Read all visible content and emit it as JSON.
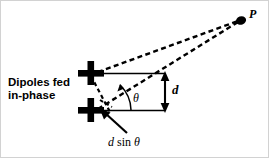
{
  "figure": {
    "background_color": "#ffffff",
    "stroke_color": "#000000",
    "border_color": "#cfcfcf",
    "width": 269,
    "height": 158
  },
  "labels": {
    "caption_line1": "Dipoles fed",
    "caption_line2": "in-phase",
    "caption_full": "Dipoles fed in-phase",
    "point_p": "P",
    "spacing_d": "d",
    "angle_theta": "θ",
    "path_difference_d": "d",
    "path_difference_sin": "sin",
    "path_difference_theta": "θ",
    "path_difference_full": "d sin θ"
  },
  "elements": {
    "dipole_top_name": "dipole-top",
    "dipole_bottom_name": "dipole-bottom",
    "observation_point_name": "observation-point-P",
    "ray_top_name": "dashed-ray-top-dipole-to-P",
    "ray_bottom_name": "dashed-ray-bottom-dipole-to-P",
    "baseline_top_name": "solid-horizontal-reference-top",
    "baseline_bottom_name": "solid-horizontal-reference-bottom",
    "spacing_arrow_name": "double-headed-spacing-arrow",
    "angle_arc_name": "angle-arc-theta",
    "path_diff_segment_name": "dashed-path-difference-segment",
    "pointer_arrow_name": "pointer-arrow-to-path-difference"
  },
  "geometry": {
    "dipole_top_xy": [
      90,
      73
    ],
    "dipole_bottom_xy": [
      90,
      110
    ],
    "point_p_xy": [
      241,
      20
    ],
    "spacing_arrow_x": 165,
    "reference_line_right_x": 165,
    "angle_vertex_xy": [
      95,
      110
    ],
    "angle_theta_degrees": 20
  }
}
